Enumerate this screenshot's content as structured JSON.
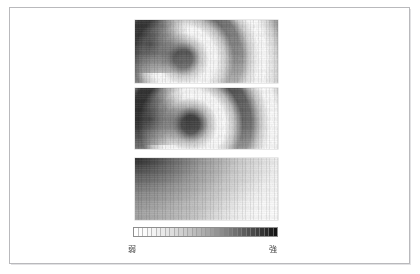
{
  "figure": {
    "background_color": "#ffffff",
    "frame_color": "#b9b9bc",
    "panel_count": 3
  },
  "panels": [
    {
      "name": "interference-fringe-panel-top",
      "kind": "grayscale-raster-image",
      "description": "curved interference fringe pattern, dark blob upper-left",
      "x": 134,
      "y": 19,
      "width": 143,
      "height": 63
    },
    {
      "name": "interference-fringe-panel-middle",
      "kind": "grayscale-raster-image",
      "description": "curved interference fringe pattern, higher contrast",
      "x": 134,
      "y": 87,
      "width": 143,
      "height": 61
    },
    {
      "name": "intensity-gradient-panel-bottom",
      "kind": "grayscale-raster-image",
      "description": "smooth diagonal intensity gradient, dark upper-left to white lower-right",
      "x": 134,
      "y": 157,
      "width": 143,
      "height": 62
    }
  ],
  "colorbar": {
    "x": 132,
    "y": 226,
    "width": 145,
    "height": 10,
    "orientation": "horizontal",
    "segment_count": 32,
    "low_color": "#ffffff",
    "high_color": "#141414",
    "border_color": "#8e8e8e",
    "label_low": "弱",
    "label_high": "強"
  },
  "chart_data": {
    "type": "heatmap",
    "title": "",
    "subtitle": "",
    "xlabel": "",
    "ylabel": "",
    "grid": false,
    "legend_position": "bottom",
    "colormap": "grayscale-inverted",
    "colorbar_ticks": [
      "弱",
      "強"
    ],
    "colorbar_tick_meaning": [
      "weak",
      "strong"
    ],
    "panels": [
      {
        "name": "interference-fringe-panel-top",
        "series": "fringe-intensity",
        "pattern": "concentric-arc-fringes",
        "arc_center_rel": [
          -0.18,
          0.12
        ],
        "fringe_period_px": 26,
        "intensity_range": [
          0.08,
          0.97
        ],
        "hotspot_rel": [
          0.08,
          0.18
        ],
        "hotspot_intensity": 0.92
      },
      {
        "name": "interference-fringe-panel-middle",
        "series": "fringe-intensity",
        "pattern": "concentric-arc-fringes",
        "arc_center_rel": [
          -0.16,
          0.28
        ],
        "fringe_period_px": 27,
        "intensity_range": [
          0.05,
          0.99
        ],
        "hotspot_rel": [
          0.1,
          0.32
        ],
        "hotspot_intensity": 0.95
      },
      {
        "name": "intensity-gradient-panel-bottom",
        "series": "smooth-intensity",
        "pattern": "diagonal-gradient",
        "gradient_angle_deg": 116,
        "intensity_range": [
          0.02,
          0.9
        ],
        "max_corner": "top-left",
        "min_corner": "bottom-right"
      }
    ],
    "colorbar_scale": {
      "min_label": "弱",
      "max_label": "強",
      "min_value": 0,
      "max_value": 1,
      "steps": 32
    }
  }
}
